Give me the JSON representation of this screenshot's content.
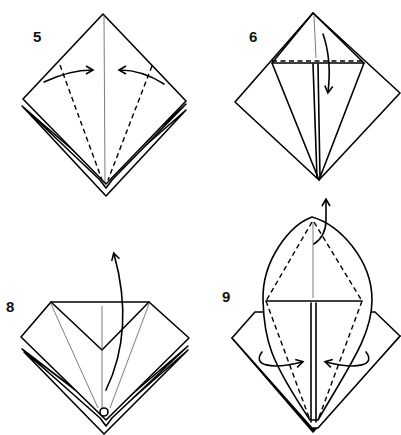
{
  "diagram": {
    "type": "origami-instructions",
    "steps": [
      {
        "number": "5",
        "description": "valley fold both lower edges to center crease",
        "arrows": [
          "arrow-right-in",
          "arrow-left-in"
        ]
      },
      {
        "number": "6",
        "description": "fold top triangle down along dashed line",
        "arrows": [
          "arrow-down"
        ]
      },
      {
        "number": "8",
        "description": "petal fold: lift bottom point up",
        "arrows": [
          "arrow-up-curved"
        ],
        "symbols": [
          "hold-point-circle"
        ]
      },
      {
        "number": "9",
        "description": "fold top flap behind, fold sides in",
        "arrows": [
          "arrow-behind-top",
          "arrow-in-left",
          "arrow-in-right"
        ]
      }
    ]
  },
  "colors": {
    "line": "#000000",
    "background": "#ffffff"
  }
}
